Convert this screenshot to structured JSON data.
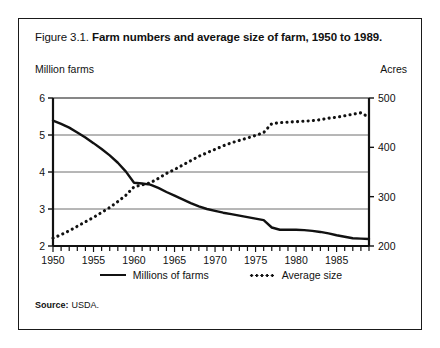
{
  "figure": {
    "number": "Figure 3.1.",
    "title": "Farm numbers and average size of farm, 1950 to 1989.",
    "source_label": "Source:",
    "source_value": "USDA."
  },
  "axes": {
    "left_title": "Million farms",
    "right_title": "Acres",
    "left_ticks": [
      "6",
      "5",
      "4",
      "3",
      "2"
    ],
    "right_ticks": [
      "500",
      "400",
      "300",
      "200"
    ],
    "x_ticks": [
      "1950",
      "1955",
      "1960",
      "1965",
      "1970",
      "1975",
      "1980",
      "1985"
    ]
  },
  "legend": {
    "items": [
      {
        "label": "Millions of farms",
        "style": "solid"
      },
      {
        "label": "Average size",
        "style": "dotted"
      }
    ]
  },
  "colors": {
    "ink": "#111111",
    "frame": "#1a1a1a",
    "gridline": "#6f6f6f",
    "background": "#ffffff"
  },
  "chart_data": {
    "type": "line",
    "title": "Farm numbers and average size of farm, 1950 to 1989",
    "xlabel": "",
    "ylabel": "Million farms",
    "y2label": "Acres",
    "xlim": [
      1950,
      1989
    ],
    "ylim": [
      2,
      6
    ],
    "y2lim": [
      200,
      500
    ],
    "grid": true,
    "legend_position": "bottom-center",
    "x": [
      1950,
      1951,
      1952,
      1953,
      1954,
      1955,
      1956,
      1957,
      1958,
      1959,
      1960,
      1961,
      1962,
      1963,
      1964,
      1965,
      1966,
      1967,
      1968,
      1969,
      1970,
      1971,
      1972,
      1973,
      1974,
      1975,
      1976,
      1977,
      1978,
      1979,
      1980,
      1981,
      1982,
      1983,
      1984,
      1985,
      1986,
      1987,
      1988,
      1989
    ],
    "series": [
      {
        "name": "Millions of farms",
        "style": "solid",
        "axis": "left",
        "unit": "million farms",
        "values": [
          5.39,
          5.3,
          5.2,
          5.07,
          4.93,
          4.78,
          4.62,
          4.45,
          4.25,
          4.01,
          3.71,
          3.69,
          3.66,
          3.57,
          3.46,
          3.36,
          3.26,
          3.16,
          3.07,
          3.0,
          2.95,
          2.9,
          2.86,
          2.82,
          2.78,
          2.74,
          2.7,
          2.5,
          2.44,
          2.44,
          2.44,
          2.43,
          2.41,
          2.38,
          2.34,
          2.29,
          2.25,
          2.21,
          2.2,
          2.19
        ]
      },
      {
        "name": "Average size",
        "style": "dotted",
        "axis": "right",
        "unit": "acres",
        "values": [
          216,
          223,
          231,
          240,
          249,
          258,
          268,
          278,
          290,
          303,
          320,
          324,
          328,
          337,
          347,
          355,
          364,
          373,
          382,
          389,
          396,
          403,
          409,
          414,
          419,
          424,
          430,
          448,
          450,
          451,
          452,
          453,
          454,
          456,
          459,
          461,
          464,
          467,
          470,
          461
        ]
      }
    ],
    "annotations": [
      "Series cross near 1962 at about 3.65 million farms / 328 acres",
      "Step change in both series between 1976 and 1977 (definition change)"
    ]
  }
}
